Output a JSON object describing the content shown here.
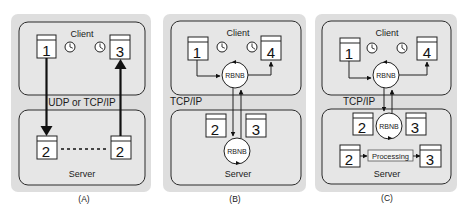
{
  "colors": {
    "panel_bg": "#dedede",
    "box_fill": "#e6e6e6",
    "box_stroke": "#2a2a2a",
    "doc_fill": "#ffffff",
    "arrow": "#111111"
  },
  "panels": [
    {
      "id": "A",
      "caption": "(A)",
      "client_label": "Client",
      "server_label": "Server",
      "protocol_label": "UDP or TCP/IP",
      "client_docs": [
        "1",
        "3"
      ],
      "server_docs": [
        "2",
        "2"
      ],
      "icons": [
        "clock-icon",
        "clock-icon"
      ]
    },
    {
      "id": "B",
      "caption": "(B)",
      "client_label": "Client",
      "server_label": "Server",
      "protocol_label": "TCP/IP",
      "client_docs": [
        "1",
        "4"
      ],
      "server_docs": [
        "2",
        "3"
      ],
      "client_node": "RBNB",
      "server_node": "RBNB",
      "icons": [
        "clock-icon",
        "clock-icon"
      ]
    },
    {
      "id": "C",
      "caption": "(C)",
      "client_label": "Client",
      "server_label": "Server",
      "protocol_label": "TCP/IP",
      "client_docs": [
        "1",
        "4"
      ],
      "server_docs": [
        "2",
        "3",
        "2",
        "3"
      ],
      "client_node": "RBNB",
      "server_node": "RBNB",
      "processing_label": "Processing",
      "icons": [
        "clock-icon",
        "clock-icon"
      ]
    }
  ]
}
